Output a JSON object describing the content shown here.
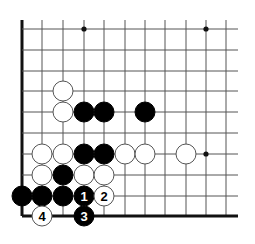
{
  "diagram": {
    "type": "go-board-fragment",
    "grid": {
      "x_lines": [
        22,
        42,
        63,
        84,
        104,
        125,
        145,
        165,
        186,
        206,
        226
      ],
      "y_lines": [
        29,
        50,
        71,
        91,
        112,
        133,
        154,
        175,
        196,
        216
      ],
      "x_extent": [
        22,
        238
      ],
      "y_extent": [
        20,
        216
      ],
      "left_edge_is_border": true,
      "bottom_edge_is_border": true,
      "line_color": "#555555",
      "border_color": "#111111"
    },
    "star_points": [
      {
        "col": 3,
        "row": 0
      },
      {
        "col": 9,
        "row": 0
      },
      {
        "col": 9,
        "row": 6
      }
    ],
    "stone_radius": 10,
    "colors": {
      "black": "#000000",
      "white": "#ffffff",
      "white_outline": "#555555",
      "label_on_black": "#ffffff",
      "label_on_white": "#000000"
    },
    "stones": [
      {
        "color": "white",
        "col": 2,
        "row": 3,
        "label": ""
      },
      {
        "color": "white",
        "col": 2,
        "row": 4,
        "label": ""
      },
      {
        "color": "black",
        "col": 3,
        "row": 4,
        "label": ""
      },
      {
        "color": "black",
        "col": 4,
        "row": 4,
        "label": ""
      },
      {
        "color": "black",
        "col": 6,
        "row": 4,
        "label": ""
      },
      {
        "color": "white",
        "col": 1,
        "row": 6,
        "label": ""
      },
      {
        "color": "white",
        "col": 2,
        "row": 6,
        "label": ""
      },
      {
        "color": "black",
        "col": 3,
        "row": 6,
        "label": ""
      },
      {
        "color": "black",
        "col": 4,
        "row": 6,
        "label": ""
      },
      {
        "color": "white",
        "col": 5,
        "row": 6,
        "label": ""
      },
      {
        "color": "white",
        "col": 6,
        "row": 6,
        "label": ""
      },
      {
        "color": "white",
        "col": 8,
        "row": 6,
        "label": ""
      },
      {
        "color": "white",
        "col": 1,
        "row": 7,
        "label": ""
      },
      {
        "color": "black",
        "col": 2,
        "row": 7,
        "label": ""
      },
      {
        "color": "white",
        "col": 3,
        "row": 7,
        "label": ""
      },
      {
        "color": "white",
        "col": 4,
        "row": 7,
        "label": ""
      },
      {
        "color": "black",
        "col": 0,
        "row": 8,
        "label": ""
      },
      {
        "color": "black",
        "col": 1,
        "row": 8,
        "label": ""
      },
      {
        "color": "black",
        "col": 2,
        "row": 8,
        "label": ""
      },
      {
        "color": "black",
        "col": 3,
        "row": 8,
        "label": "1"
      },
      {
        "color": "white",
        "col": 4,
        "row": 8,
        "label": "2"
      },
      {
        "color": "black",
        "col": 3,
        "row": 9,
        "label": "3"
      },
      {
        "color": "white",
        "col": 1,
        "row": 9,
        "label": "4"
      }
    ]
  }
}
